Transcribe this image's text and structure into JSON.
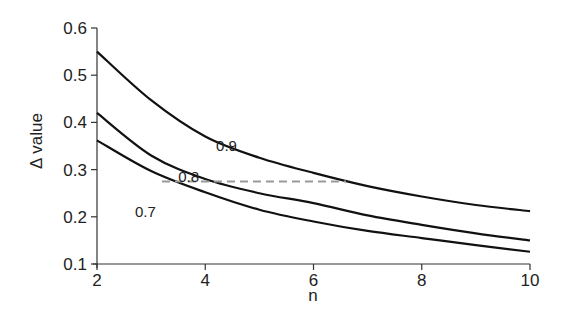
{
  "chart_data": {
    "type": "line",
    "title": "",
    "xlabel": "n",
    "ylabel": "Δ value",
    "xlim": [
      2,
      10
    ],
    "ylim": [
      0.1,
      0.6
    ],
    "xticks": [
      2,
      4,
      6,
      8,
      10
    ],
    "yticks": [
      0.1,
      0.2,
      0.3,
      0.4,
      0.5,
      0.6
    ],
    "xtick_labels": [
      "2",
      "4",
      "6",
      "8",
      "10"
    ],
    "ytick_labels": [
      "0.1",
      "0.2",
      "0.3",
      "0.4",
      "0.5",
      "0.6"
    ],
    "grid": false,
    "legend": "none (inline curve labels)",
    "x": [
      2,
      3,
      4,
      5,
      6,
      7,
      8,
      9,
      10
    ],
    "series": [
      {
        "name": "0.9",
        "color": "#111111",
        "values": [
          0.55,
          0.447,
          0.37,
          0.325,
          0.293,
          0.265,
          0.243,
          0.225,
          0.212
        ]
      },
      {
        "name": "0.8",
        "color": "#111111",
        "values": [
          0.42,
          0.33,
          0.28,
          0.25,
          0.229,
          0.203,
          0.183,
          0.165,
          0.15
        ]
      },
      {
        "name": "0.7",
        "color": "#111111",
        "values": [
          0.362,
          0.297,
          0.252,
          0.215,
          0.19,
          0.17,
          0.155,
          0.14,
          0.126
        ]
      }
    ],
    "annotations": [
      {
        "text": "0.9",
        "x": 4.2,
        "y": 0.34
      },
      {
        "text": "0.8",
        "x": 3.5,
        "y": 0.274
      },
      {
        "text": "0.7",
        "x": 2.7,
        "y": 0.2
      }
    ],
    "reference_lines": [
      {
        "style": "dashed",
        "color": "#999999",
        "y": 0.275,
        "x_start": 3.2,
        "x_end": 6.6
      }
    ]
  }
}
